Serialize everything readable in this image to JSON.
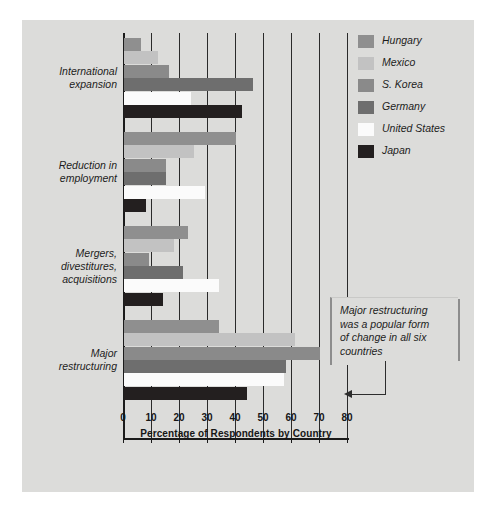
{
  "chart_data": {
    "type": "bar",
    "orientation": "horizontal",
    "title": "",
    "xlabel": "Percentage of Respondents by Country",
    "ylabel": "",
    "xlim": [
      0,
      80
    ],
    "xticks": [
      0,
      10,
      20,
      30,
      40,
      50,
      60,
      70,
      80
    ],
    "grid": true,
    "legend_position": "top-right",
    "categories": [
      "International expansion",
      "Reduction in employment",
      "Mergers, divestitures, acquisitions",
      "Major restructuring"
    ],
    "series": [
      {
        "name": "Hungary",
        "color": "#8f8f8f",
        "values": [
          6,
          40,
          23,
          34
        ]
      },
      {
        "name": "Mexico",
        "color": "#c2c2c2",
        "values": [
          12,
          25,
          18,
          61
        ]
      },
      {
        "name": "S. Korea",
        "color": "#8a8a8a",
        "values": [
          16,
          15,
          9,
          70
        ]
      },
      {
        "name": "Germany",
        "color": "#6e6e6e",
        "values": [
          46,
          15,
          21,
          58
        ]
      },
      {
        "name": "United States",
        "color": "#fbfbfb",
        "values": [
          24,
          29,
          34,
          57
        ]
      },
      {
        "name": "Japan",
        "color": "#231f1f",
        "values": [
          42,
          8,
          14,
          44
        ]
      }
    ],
    "annotations": [
      {
        "text": "Major restructuring was a popular form of change in all six countries",
        "lines": [
          "Major restructuring",
          "was a popular form",
          "of change in all six",
          "countries"
        ],
        "points_to": "S. Korea bar in Major restructuring"
      }
    ]
  },
  "colors": {
    "background": "#ffffff",
    "plate": "#dcdcda",
    "axis": "#1b1b1b",
    "gridline": "#2a2a2a",
    "text": "#1c1c1c",
    "callout_shadow": "#8d8d8d"
  }
}
